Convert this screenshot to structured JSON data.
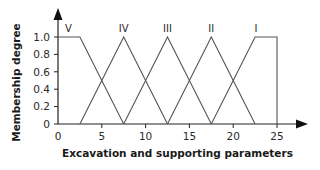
{
  "chart_data": {
    "type": "line",
    "title": "",
    "xlabel": "Excavation and supporting parameters",
    "ylabel": "Membership degree",
    "xlim": [
      0,
      25
    ],
    "ylim": [
      0,
      1.0
    ],
    "grid": false,
    "xticks": [
      0,
      5,
      10,
      15,
      20,
      25
    ],
    "xtick_labels": [
      "0",
      "5",
      "10",
      "15",
      "20",
      "25"
    ],
    "yticks": [
      0,
      0.2,
      0.4,
      0.6,
      0.8,
      1.0
    ],
    "ytick_labels": [
      "0",
      "0.2",
      "0.4",
      "0.6",
      "0.8",
      "1.0"
    ],
    "series": [
      {
        "name": "V",
        "x": [
          0,
          2.5,
          7.5
        ],
        "y": [
          1,
          1,
          0
        ]
      },
      {
        "name": "IV",
        "x": [
          2.5,
          7.5,
          12.5
        ],
        "y": [
          0,
          1,
          0
        ]
      },
      {
        "name": "III",
        "x": [
          7.5,
          12.5,
          17.5
        ],
        "y": [
          0,
          1,
          0
        ]
      },
      {
        "name": "II",
        "x": [
          12.5,
          17.5,
          22.5
        ],
        "y": [
          0,
          1,
          0
        ]
      },
      {
        "name": "I",
        "x": [
          17.5,
          22.5,
          25,
          25
        ],
        "y": [
          0,
          1,
          1,
          0
        ]
      }
    ],
    "series_label_positions": [
      {
        "name": "V",
        "x": 1.2
      },
      {
        "name": "IV",
        "x": 7.5
      },
      {
        "name": "III",
        "x": 12.5
      },
      {
        "name": "II",
        "x": 17.5
      },
      {
        "name": "I",
        "x": 22.6
      }
    ]
  }
}
